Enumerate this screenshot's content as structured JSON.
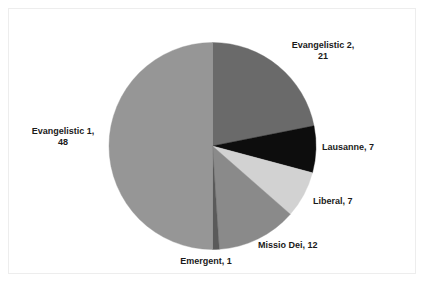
{
  "figure": {
    "background_color": "#ffffff",
    "frame_color": "#ededed",
    "label_color": "#1a1a1a"
  },
  "chart_data": {
    "type": "pie",
    "title": "",
    "subtitle": "",
    "xlabel": "",
    "ylabel": "",
    "total": 96,
    "start_angle_deg": 0,
    "direction": "clockwise",
    "grid": false,
    "legend_position": "none",
    "labels_outside": true,
    "label_format": "name, value",
    "categories": [
      "Evangelistic 2",
      "Lausanne",
      "Liberal",
      "Missio Dei",
      "Emergent",
      "Evangelistic 1"
    ],
    "values": [
      21,
      7,
      7,
      12,
      1,
      48
    ],
    "colors": [
      "#6a6a6a",
      "#0d0d0d",
      "#d2d2d2",
      "#8a8a8a",
      "#5a5a5a",
      "#969696"
    ],
    "slices": [
      {
        "name": "Evangelistic 2",
        "value": 21,
        "color": "#6a6a6a",
        "start_deg": 0,
        "sweep_deg": 78.75,
        "label_text": "Evangelistic 2,\n21"
      },
      {
        "name": "Lausanne",
        "value": 7,
        "color": "#0d0d0d",
        "start_deg": 78.75,
        "sweep_deg": 26.25,
        "label_text": "Lausanne, 7"
      },
      {
        "name": "Liberal",
        "value": 7,
        "color": "#d2d2d2",
        "start_deg": 105,
        "sweep_deg": 26.25,
        "label_text": "Liberal, 7"
      },
      {
        "name": "Missio Dei",
        "value": 12,
        "color": "#8a8a8a",
        "start_deg": 131.25,
        "sweep_deg": 45,
        "label_text": "Missio Dei, 12"
      },
      {
        "name": "Emergent",
        "value": 1,
        "color": "#5a5a5a",
        "start_deg": 176.25,
        "sweep_deg": 3.75,
        "label_text": "Emergent, 1"
      },
      {
        "name": "Evangelistic 1",
        "value": 48,
        "color": "#969696",
        "start_deg": 180,
        "sweep_deg": 180,
        "label_text": "Evangelistic 1,\n48"
      }
    ]
  },
  "labels": {
    "evangelistic_2": "Evangelistic 2,\n21",
    "lausanne": "Lausanne, 7",
    "liberal": "Liberal, 7",
    "missio_dei": "Missio Dei, 12",
    "emergent": "Emergent, 1",
    "evangelistic_1": "Evangelistic 1,\n48"
  }
}
